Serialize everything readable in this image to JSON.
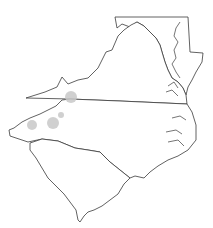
{
  "map": {
    "type": "range-map",
    "region": "Mid-Atlantic / Southeastern United States",
    "states": [
      "Maryland",
      "Delaware",
      "Virginia",
      "North Carolina",
      "South Carolina"
    ],
    "colors": {
      "background": "#ffffff",
      "outline": "#3a3a3a",
      "occurrence": "#c8c8c8"
    },
    "occurrences": [
      {
        "id": 1,
        "cx": 71,
        "cy": 97,
        "r": 6
      },
      {
        "id": 2,
        "cx": 53,
        "cy": 123,
        "r": 6
      },
      {
        "id": 3,
        "cx": 32,
        "cy": 125,
        "r": 5
      },
      {
        "id": 4,
        "cx": 61,
        "cy": 115,
        "r": 3
      }
    ]
  }
}
